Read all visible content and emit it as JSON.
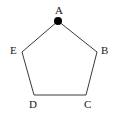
{
  "figure": {
    "type": "geometry-diagram",
    "shape_name": "pentagon",
    "background_color": "#ffffff",
    "stroke_color": "#3a3a3a",
    "stroke_width": 1,
    "marker_color": "#000000",
    "label_color": "#1a1a1a",
    "canvas": {
      "width": 116,
      "height": 118
    },
    "vertices": [
      {
        "label": "A",
        "x": 58,
        "y": 21,
        "label_x": 55,
        "label_y": 5,
        "marked": true
      },
      {
        "label": "B",
        "x": 97,
        "y": 52,
        "label_x": 101,
        "label_y": 45,
        "marked": false
      },
      {
        "label": "C",
        "x": 86,
        "y": 95,
        "label_x": 84,
        "label_y": 99,
        "marked": false
      },
      {
        "label": "D",
        "x": 34,
        "y": 95,
        "label_x": 29,
        "label_y": 99,
        "marked": false
      },
      {
        "label": "E",
        "x": 22,
        "y": 52,
        "label_x": 10,
        "label_y": 45,
        "marked": false
      }
    ],
    "edges": [
      {
        "from": "A",
        "to": "B"
      },
      {
        "from": "B",
        "to": "C"
      },
      {
        "from": "C",
        "to": "D"
      },
      {
        "from": "D",
        "to": "E"
      },
      {
        "from": "E",
        "to": "A"
      }
    ],
    "marker": {
      "vertex": "A",
      "radius": 4,
      "style": "filled-circle"
    }
  }
}
